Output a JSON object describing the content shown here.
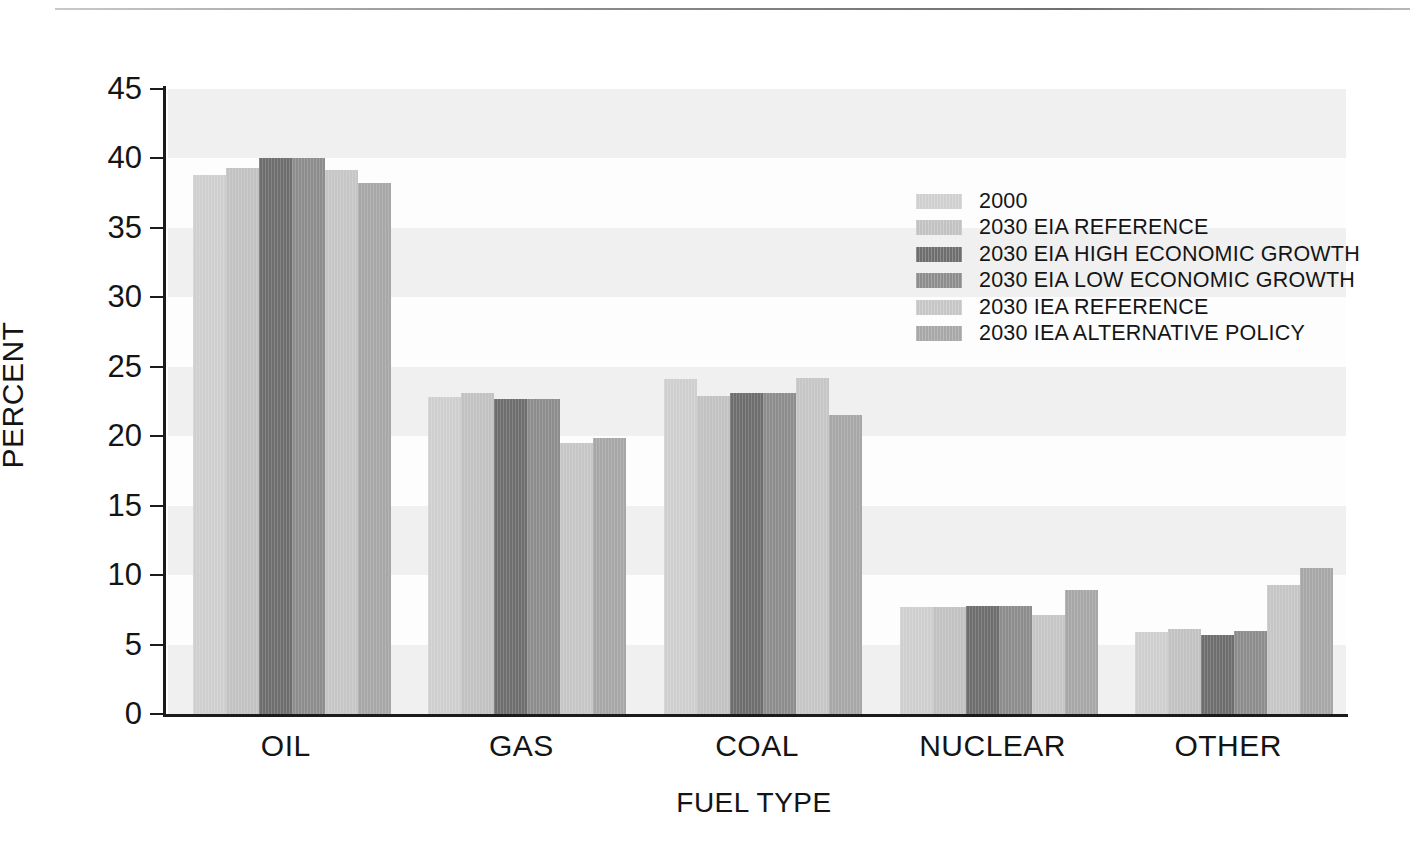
{
  "chart_data": {
    "type": "bar",
    "title": "",
    "xlabel": "FUEL TYPE",
    "ylabel": "PERCENT",
    "ylim": [
      0,
      45
    ],
    "ytick_step": 5,
    "yticks": [
      "0",
      "5",
      "10",
      "15",
      "20",
      "25",
      "30",
      "35",
      "40",
      "45"
    ],
    "grid": "horizontal-bands",
    "legend_position": "inside-top-right",
    "categories": [
      "OIL",
      "GAS",
      "COAL",
      "NUCLEAR",
      "OTHER"
    ],
    "series": [
      {
        "name": "2000",
        "color": "#cfcfcf",
        "values": [
          38.8,
          22.8,
          24.1,
          7.7,
          5.9
        ]
      },
      {
        "name": "2030 EIA REFERENCE",
        "color": "#c2c2c2",
        "values": [
          39.3,
          23.1,
          22.9,
          7.7,
          6.1
        ]
      },
      {
        "name": "2030 EIA HIGH ECONOMIC GROWTH",
        "color": "#6e6e6e",
        "values": [
          40.0,
          22.7,
          23.1,
          7.8,
          5.7
        ]
      },
      {
        "name": "2030 EIA LOW ECONOMIC GROWTH",
        "color": "#8d8d8d",
        "values": [
          40.0,
          22.7,
          23.1,
          7.8,
          6.0
        ]
      },
      {
        "name": "2030 IEA REFERENCE",
        "color": "#c6c6c6",
        "values": [
          39.2,
          19.5,
          24.2,
          7.1,
          9.3
        ]
      },
      {
        "name": "2030 IEA ALTERNATIVE POLICY",
        "color": "#a7a7a7",
        "values": [
          38.2,
          19.9,
          21.5,
          8.9,
          10.5
        ]
      }
    ]
  },
  "colors": {
    "axis": "#1b1b1b",
    "band": "#f0f0f0",
    "plot_background": "#fdfdfd",
    "text": "#141414"
  }
}
